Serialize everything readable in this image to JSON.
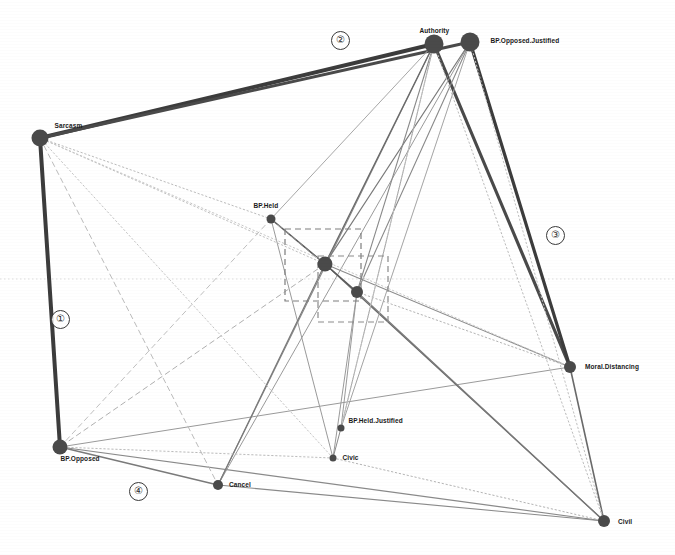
{
  "figure": {
    "type": "network-graph",
    "background": "#ffffff",
    "width": 675,
    "height": 555,
    "node_color": "#4a4a4a",
    "edge_color_strong": "#3c3c3c",
    "edge_color_faint": "#b8b8b8",
    "guide_line_y": 279
  },
  "nodes": [
    {
      "id": "sarcasm",
      "label": "Sarcasm",
      "x": 40,
      "y": 138,
      "r": 8.5,
      "label_dx": 6,
      "label_dy": -16,
      "label_align": "left"
    },
    {
      "id": "authority",
      "label": "Authority",
      "x": 434,
      "y": 44,
      "r": 9.5,
      "label_dx": -24,
      "label_dy": -17,
      "label_align": "left"
    },
    {
      "id": "bp_opposed_just",
      "label": "BP.Opposed.Justified",
      "x": 470,
      "y": 42,
      "r": 9.5,
      "label_dx": 11,
      "label_dy": -5,
      "label_align": "left"
    },
    {
      "id": "bp_held",
      "label": "BP.Held",
      "x": 271,
      "y": 219,
      "r": 4.5,
      "label_dx": -22,
      "label_dy": -17,
      "label_align": "left"
    },
    {
      "id": "cluster_a",
      "label": "",
      "x": 325,
      "y": 264,
      "r": 7.5,
      "label_dx": 0,
      "label_dy": 0,
      "label_align": "left"
    },
    {
      "id": "cluster_b",
      "label": "",
      "x": 357,
      "y": 292,
      "r": 6.0,
      "label_dx": 0,
      "label_dy": 0,
      "label_align": "left"
    },
    {
      "id": "moral_distancing",
      "label": "Moral.Distancing",
      "x": 570,
      "y": 367,
      "r": 6.0,
      "label_dx": 9,
      "label_dy": -4,
      "label_align": "left"
    },
    {
      "id": "bp_held_just",
      "label": "BP.Held.Justified",
      "x": 341,
      "y": 428,
      "r": 3.5,
      "label_dx": 4,
      "label_dy": -11,
      "label_align": "left"
    },
    {
      "id": "civic",
      "label": "Civic",
      "x": 333,
      "y": 458,
      "r": 3.5,
      "label_dx": 6,
      "label_dy": -4,
      "label_align": "left"
    },
    {
      "id": "bp_opposed",
      "label": "BP.Opposed",
      "x": 60,
      "y": 447,
      "r": 7.5,
      "label_dx": -7,
      "label_dy": 8,
      "label_align": "left"
    },
    {
      "id": "cancel",
      "label": "Cancel",
      "x": 218,
      "y": 485,
      "r": 5.0,
      "label_dx": 6,
      "label_dy": -4,
      "label_align": "left"
    },
    {
      "id": "civil",
      "label": "Civil",
      "x": 604,
      "y": 521,
      "r": 6.0,
      "label_dx": 8,
      "label_dy": -3,
      "label_align": "left"
    }
  ],
  "edges": [
    {
      "from": "sarcasm",
      "to": "authority",
      "weight": 4.0,
      "style": "solid",
      "shade": "#3c3c3c"
    },
    {
      "from": "sarcasm",
      "to": "bp_opposed_just",
      "weight": 3.0,
      "style": "solid",
      "shade": "#4a4a4a"
    },
    {
      "from": "sarcasm",
      "to": "bp_opposed",
      "weight": 4.0,
      "style": "solid",
      "shade": "#3c3c3c"
    },
    {
      "from": "authority",
      "to": "moral_distancing",
      "weight": 3.2,
      "style": "solid",
      "shade": "#4a4a4a"
    },
    {
      "from": "bp_opposed_just",
      "to": "moral_distancing",
      "weight": 3.2,
      "style": "solid",
      "shade": "#3c3c3c"
    },
    {
      "from": "moral_distancing",
      "to": "civil",
      "weight": 1.6,
      "style": "solid",
      "shade": "#6a6a6a"
    },
    {
      "from": "bp_opposed",
      "to": "cancel",
      "weight": 1.4,
      "style": "solid",
      "shade": "#7a7a7a"
    },
    {
      "from": "bp_opposed",
      "to": "civil",
      "weight": 1.2,
      "style": "solid",
      "shade": "#8a8a8a"
    },
    {
      "from": "bp_opposed",
      "to": "moral_distancing",
      "weight": 1.0,
      "style": "solid",
      "shade": "#9a9a9a"
    },
    {
      "from": "cancel",
      "to": "civil",
      "weight": 1.1,
      "style": "solid",
      "shade": "#8a8a8a"
    },
    {
      "from": "cancel",
      "to": "authority",
      "weight": 1.1,
      "style": "solid",
      "shade": "#8a8a8a"
    },
    {
      "from": "cancel",
      "to": "bp_opposed_just",
      "weight": 1.0,
      "style": "solid",
      "shade": "#9a9a9a"
    },
    {
      "from": "bp_held",
      "to": "cluster_a",
      "weight": 1.6,
      "style": "solid",
      "shade": "#5a5a5a"
    },
    {
      "from": "bp_held",
      "to": "cluster_b",
      "weight": 1.0,
      "style": "dashed",
      "shade": "#a0a0a0"
    },
    {
      "from": "bp_held",
      "to": "sarcasm",
      "weight": 1.0,
      "style": "dotted",
      "shade": "#bcbcbc"
    },
    {
      "from": "bp_held",
      "to": "authority",
      "weight": 1.0,
      "style": "solid",
      "shade": "#a8a8a8"
    },
    {
      "from": "bp_held",
      "to": "civic",
      "weight": 1.0,
      "style": "solid",
      "shade": "#9a9a9a"
    },
    {
      "from": "cluster_a",
      "to": "authority",
      "weight": 1.3,
      "style": "solid",
      "shade": "#6a6a6a"
    },
    {
      "from": "cluster_a",
      "to": "bp_opposed_just",
      "weight": 1.2,
      "style": "solid",
      "shade": "#7a7a7a"
    },
    {
      "from": "cluster_a",
      "to": "moral_distancing",
      "weight": 1.1,
      "style": "solid",
      "shade": "#8a8a8a"
    },
    {
      "from": "cluster_a",
      "to": "civil",
      "weight": 1.3,
      "style": "solid",
      "shade": "#6a6a6a"
    },
    {
      "from": "cluster_a",
      "to": "cancel",
      "weight": 1.2,
      "style": "solid",
      "shade": "#7a7a7a"
    },
    {
      "from": "cluster_a",
      "to": "bp_opposed",
      "weight": 1.0,
      "style": "dashed",
      "shade": "#b0b0b0"
    },
    {
      "from": "cluster_a",
      "to": "cluster_b",
      "weight": 1.4,
      "style": "solid",
      "shade": "#5a5a5a"
    },
    {
      "from": "cluster_b",
      "to": "authority",
      "weight": 1.1,
      "style": "solid",
      "shade": "#8a8a8a"
    },
    {
      "from": "cluster_b",
      "to": "bp_opposed_just",
      "weight": 1.1,
      "style": "solid",
      "shade": "#8a8a8a"
    },
    {
      "from": "cluster_b",
      "to": "moral_distancing",
      "weight": 1.0,
      "style": "dotted",
      "shade": "#b4b4b4"
    },
    {
      "from": "cluster_b",
      "to": "civil",
      "weight": 1.2,
      "style": "solid",
      "shade": "#7a7a7a"
    },
    {
      "from": "cluster_b",
      "to": "civic",
      "weight": 1.0,
      "style": "solid",
      "shade": "#9a9a9a"
    },
    {
      "from": "cluster_b",
      "to": "bp_held_just",
      "weight": 1.0,
      "style": "solid",
      "shade": "#9a9a9a"
    },
    {
      "from": "bp_held_just",
      "to": "civic",
      "weight": 1.0,
      "style": "solid",
      "shade": "#8a8a8a"
    },
    {
      "from": "bp_held_just",
      "to": "authority",
      "weight": 1.0,
      "style": "solid",
      "shade": "#a4a4a4"
    },
    {
      "from": "bp_held_just",
      "to": "bp_opposed_just",
      "weight": 1.0,
      "style": "solid",
      "shade": "#a4a4a4"
    },
    {
      "from": "civic",
      "to": "civil",
      "weight": 1.0,
      "style": "dotted",
      "shade": "#b4b4b4"
    },
    {
      "from": "civic",
      "to": "bp_opposed",
      "weight": 1.0,
      "style": "dotted",
      "shade": "#bcbcbc"
    },
    {
      "from": "sarcasm",
      "to": "cluster_a",
      "weight": 1.0,
      "style": "dotted",
      "shade": "#c0c0c0"
    },
    {
      "from": "sarcasm",
      "to": "cancel",
      "weight": 1.0,
      "style": "dashed",
      "shade": "#bcbcbc"
    },
    {
      "from": "sarcasm",
      "to": "civic",
      "weight": 1.0,
      "style": "dotted",
      "shade": "#c4c4c4"
    },
    {
      "from": "sarcasm",
      "to": "moral_distancing",
      "weight": 1.0,
      "style": "dotted",
      "shade": "#c8c8c8"
    },
    {
      "from": "authority",
      "to": "civil",
      "weight": 1.0,
      "style": "dotted",
      "shade": "#bcbcbc"
    },
    {
      "from": "bp_opposed_just",
      "to": "civil",
      "weight": 1.0,
      "style": "dotted",
      "shade": "#c0c0c0"
    },
    {
      "from": "authority",
      "to": "bp_held_just",
      "weight": 1.0,
      "style": "dotted",
      "shade": "#c4c4c4"
    },
    {
      "from": "bp_opposed",
      "to": "bp_held",
      "weight": 1.0,
      "style": "dashed",
      "shade": "#c0c0c0"
    }
  ],
  "dashed_boxes": [
    {
      "id": "box-upper",
      "x": 285,
      "y": 229,
      "w": 76,
      "h": 72,
      "color": "#7d7d7d"
    },
    {
      "id": "box-lower",
      "x": 318,
      "y": 256,
      "w": 70,
      "h": 66,
      "color": "#8a8a8a"
    }
  ],
  "annotations": [
    {
      "id": "badge-1",
      "text": "①",
      "x": 51,
      "y": 310
    },
    {
      "id": "badge-2",
      "text": "②",
      "x": 331,
      "y": 31
    },
    {
      "id": "badge-3",
      "text": "③",
      "x": 546,
      "y": 226
    },
    {
      "id": "badge-4",
      "text": "④",
      "x": 129,
      "y": 482
    }
  ]
}
